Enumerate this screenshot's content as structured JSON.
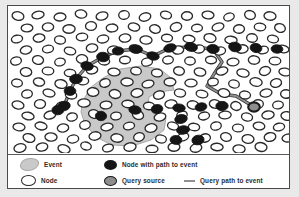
{
  "figure": {
    "background_color": "#ffffff",
    "frame_color": "#4a4a4a"
  },
  "colors": {
    "event_region": "#c9c9c9",
    "event_region_border": "#a8a8a8",
    "node_outline": "#2a2a2a",
    "node_fill": "#ffffff",
    "path_node_fill": "#151515",
    "query_source_fill": "#8e8e8e",
    "query_path_line": "#909090",
    "legend_text": "#2b2b2b"
  },
  "legend": {
    "rows": [
      [
        {
          "swatch": "event-blob-icon",
          "label": "Event"
        },
        {
          "swatch": "filled-node-icon",
          "label": "Node with path to event"
        }
      ],
      [
        {
          "swatch": "hollow-node-icon",
          "label": "Node"
        },
        {
          "swatch": "query-source-icon",
          "label": "Query source"
        },
        {
          "swatch": "query-path-line-icon",
          "label": "Query path to event"
        }
      ]
    ]
  },
  "chart_data": {
    "type": "scatter",
    "xlabel": "",
    "ylabel": "",
    "xlim": [
      0,
      281
    ],
    "ylim": [
      0,
      147
    ],
    "grid": false,
    "legend_position": "bottom",
    "annotations": [
      "Event",
      "Node",
      "Node with path to event",
      "Query source",
      "Query path to event"
    ],
    "event_region_polygon": [
      [
        75,
        95
      ],
      [
        82,
        82
      ],
      [
        95,
        72
      ],
      [
        112,
        63
      ],
      [
        133,
        60
      ],
      [
        152,
        63
      ],
      [
        163,
        72
      ],
      [
        166,
        84
      ],
      [
        150,
        86
      ],
      [
        141,
        91
      ],
      [
        140,
        99
      ],
      [
        149,
        106
      ],
      [
        158,
        112
      ],
      [
        156,
        124
      ],
      [
        143,
        134
      ],
      [
        124,
        140
      ],
      [
        104,
        139
      ],
      [
        88,
        131
      ],
      [
        77,
        118
      ],
      [
        73,
        106
      ]
    ],
    "series": [
      {
        "name": "Node",
        "marker": "hollow-ellipse",
        "points": [
          [
            10,
            10
          ],
          [
            30,
            9
          ],
          [
            52,
            11
          ],
          [
            73,
            8
          ],
          [
            94,
            10
          ],
          [
            116,
            9
          ],
          [
            137,
            11
          ],
          [
            158,
            9
          ],
          [
            179,
            10
          ],
          [
            200,
            9
          ],
          [
            221,
            11
          ],
          [
            242,
            9
          ],
          [
            262,
            10
          ],
          [
            19,
            22
          ],
          [
            40,
            21
          ],
          [
            61,
            23
          ],
          [
            83,
            20
          ],
          [
            104,
            22
          ],
          [
            126,
            21
          ],
          [
            147,
            23
          ],
          [
            168,
            21
          ],
          [
            189,
            22
          ],
          [
            210,
            21
          ],
          [
            231,
            23
          ],
          [
            252,
            21
          ],
          [
            272,
            22
          ],
          [
            9,
            33
          ],
          [
            31,
            32
          ],
          [
            52,
            34
          ],
          [
            74,
            31
          ],
          [
            95,
            33
          ],
          [
            117,
            32
          ],
          [
            138,
            34
          ],
          [
            159,
            32
          ],
          [
            181,
            33
          ],
          [
            202,
            32
          ],
          [
            223,
            34
          ],
          [
            244,
            32
          ],
          [
            265,
            33
          ],
          [
            18,
            44
          ],
          [
            40,
            43
          ],
          [
            62,
            45
          ],
          [
            84,
            42
          ],
          [
            105,
            44
          ],
          [
            127,
            43
          ],
          [
            170,
            44
          ],
          [
            191,
            43
          ],
          [
            212,
            45
          ],
          [
            234,
            43
          ],
          [
            255,
            44
          ],
          [
            275,
            43
          ],
          [
            8,
            55
          ],
          [
            30,
            54
          ],
          [
            52,
            56
          ],
          [
            74,
            53
          ],
          [
            96,
            55
          ],
          [
            117,
            54
          ],
          [
            139,
            56
          ],
          [
            160,
            54
          ],
          [
            182,
            55
          ],
          [
            203,
            54
          ],
          [
            225,
            56
          ],
          [
            246,
            54
          ],
          [
            267,
            55
          ],
          [
            18,
            66
          ],
          [
            40,
            65
          ],
          [
            62,
            67
          ],
          [
            84,
            64
          ],
          [
            106,
            66
          ],
          [
            128,
            65
          ],
          [
            149,
            67
          ],
          [
            171,
            65
          ],
          [
            192,
            66
          ],
          [
            214,
            65
          ],
          [
            235,
            67
          ],
          [
            257,
            65
          ],
          [
            277,
            66
          ],
          [
            9,
            77
          ],
          [
            31,
            76
          ],
          [
            53,
            78
          ],
          [
            75,
            75
          ],
          [
            97,
            77
          ],
          [
            119,
            76
          ],
          [
            140,
            78
          ],
          [
            162,
            76
          ],
          [
            183,
            77
          ],
          [
            205,
            76
          ],
          [
            226,
            78
          ],
          [
            248,
            76
          ],
          [
            268,
            77
          ],
          [
            19,
            88
          ],
          [
            41,
            87
          ],
          [
            63,
            89
          ],
          [
            85,
            86
          ],
          [
            107,
            88
          ],
          [
            129,
            87
          ],
          [
            151,
            89
          ],
          [
            172,
            87
          ],
          [
            194,
            88
          ],
          [
            216,
            87
          ],
          [
            237,
            89
          ],
          [
            258,
            87
          ],
          [
            278,
            88
          ],
          [
            10,
            99
          ],
          [
            32,
            98
          ],
          [
            54,
            100
          ],
          [
            76,
            97
          ],
          [
            98,
            99
          ],
          [
            120,
            98
          ],
          [
            141,
            100
          ],
          [
            163,
            98
          ],
          [
            185,
            99
          ],
          [
            207,
            98
          ],
          [
            228,
            100
          ],
          [
            250,
            98
          ],
          [
            270,
            99
          ],
          [
            20,
            110
          ],
          [
            42,
            109
          ],
          [
            64,
            111
          ],
          [
            86,
            108
          ],
          [
            108,
            110
          ],
          [
            130,
            109
          ],
          [
            152,
            111
          ],
          [
            174,
            109
          ],
          [
            196,
            110
          ],
          [
            217,
            109
          ],
          [
            239,
            111
          ],
          [
            260,
            109
          ],
          [
            279,
            110
          ],
          [
            11,
            121
          ],
          [
            33,
            120
          ],
          [
            55,
            122
          ],
          [
            77,
            119
          ],
          [
            99,
            121
          ],
          [
            121,
            120
          ],
          [
            143,
            122
          ],
          [
            165,
            120
          ],
          [
            186,
            121
          ],
          [
            208,
            120
          ],
          [
            230,
            122
          ],
          [
            251,
            120
          ],
          [
            271,
            121
          ],
          [
            21,
            132
          ],
          [
            43,
            131
          ],
          [
            65,
            133
          ],
          [
            87,
            130
          ],
          [
            109,
            132
          ],
          [
            131,
            131
          ],
          [
            153,
            133
          ],
          [
            175,
            131
          ],
          [
            197,
            132
          ],
          [
            218,
            131
          ],
          [
            240,
            133
          ],
          [
            262,
            131
          ],
          [
            280,
            132
          ],
          [
            12,
            142
          ],
          [
            34,
            141
          ],
          [
            56,
            143
          ],
          [
            78,
            140
          ],
          [
            100,
            142
          ],
          [
            122,
            141
          ],
          [
            144,
            143
          ],
          [
            166,
            141
          ],
          [
            188,
            142
          ],
          [
            209,
            141
          ],
          [
            231,
            143
          ],
          [
            253,
            141
          ]
        ]
      },
      {
        "name": "Node with path to event",
        "marker": "filled-ellipse",
        "points": [
          [
            56,
            100
          ],
          [
            62,
            85
          ],
          [
            68,
            73
          ],
          [
            79,
            60
          ],
          [
            95,
            51
          ],
          [
            110,
            45
          ],
          [
            128,
            43
          ],
          [
            145,
            50
          ],
          [
            162,
            42
          ],
          [
            183,
            41
          ],
          [
            205,
            43
          ],
          [
            227,
            41
          ],
          [
            248,
            42
          ],
          [
            269,
            43
          ],
          [
            127,
            104
          ],
          [
            149,
            103
          ],
          [
            171,
            102
          ],
          [
            193,
            101
          ],
          [
            214,
            100
          ],
          [
            173,
            113
          ],
          [
            175,
            124
          ],
          [
            168,
            134
          ],
          [
            190,
            134
          ],
          [
            93,
            110
          ],
          [
            50,
            104
          ]
        ]
      },
      {
        "name": "Query source",
        "marker": "gray-filled-ellipse",
        "points": [
          [
            246,
            101
          ]
        ]
      }
    ],
    "query_path_polyline": [
      [
        50,
        104
      ],
      [
        56,
        100
      ],
      [
        62,
        85
      ],
      [
        68,
        73
      ],
      [
        79,
        60
      ],
      [
        95,
        51
      ],
      [
        110,
        45
      ],
      [
        128,
        43
      ],
      [
        145,
        50
      ],
      [
        162,
        42
      ],
      [
        183,
        41
      ],
      [
        205,
        43
      ],
      [
        214,
        56
      ],
      [
        206,
        68
      ],
      [
        199,
        80
      ],
      [
        213,
        88
      ],
      [
        228,
        90
      ],
      [
        238,
        96
      ],
      [
        246,
        101
      ]
    ]
  }
}
